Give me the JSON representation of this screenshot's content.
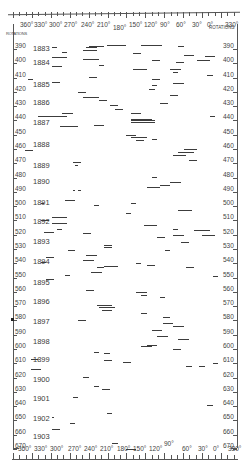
{
  "chart_data": {
    "type": "scatter",
    "title": "",
    "xlabel": "Longitude",
    "ylabel": "Rotations",
    "x_ticks_top": [
      "360°",
      "330°",
      "300°",
      "270°",
      "240°",
      "210°",
      "180°",
      "150°",
      "120°",
      "90°",
      "60°",
      "30°",
      "0°",
      "330°"
    ],
    "x_ticks_bottom": [
      "360°",
      "330°",
      "300°",
      "270°",
      "240°",
      "210°",
      "180°",
      "150°",
      "120°",
      "90°",
      "60°",
      "30°",
      "0°",
      "330°"
    ],
    "y_axis_label": "ROTATIONS",
    "y_ticks": [
      390,
      400,
      410,
      420,
      430,
      440,
      450,
      460,
      470,
      480,
      490,
      500,
      510,
      520,
      530,
      540,
      550,
      560,
      570,
      580,
      590,
      600,
      610,
      620,
      630,
      640,
      650,
      660,
      670
    ],
    "ylim": [
      385,
      672
    ],
    "xlim": [
      360,
      -30
    ],
    "years": [
      {
        "year": "1883",
        "rotation": 392
      },
      {
        "year": "1884",
        "rotation": 402
      },
      {
        "year": "1885",
        "rotation": 417
      },
      {
        "year": "1886",
        "rotation": 430
      },
      {
        "year": "1887",
        "rotation": 444
      },
      {
        "year": "1888",
        "rotation": 459
      },
      {
        "year": "1889",
        "rotation": 474
      },
      {
        "year": "1890",
        "rotation": 485
      },
      {
        "year": "1891",
        "rotation": 500
      },
      {
        "year": "1892",
        "rotation": 513
      },
      {
        "year": "1893",
        "rotation": 527
      },
      {
        "year": "1894",
        "rotation": 541
      },
      {
        "year": "1895",
        "rotation": 556
      },
      {
        "year": "1896",
        "rotation": 569
      },
      {
        "year": "1897",
        "rotation": 583
      },
      {
        "year": "1898",
        "rotation": 597
      },
      {
        "year": "1899",
        "rotation": 610
      },
      {
        "year": "1900",
        "rotation": 624
      },
      {
        "year": "1901",
        "rotation": 637
      },
      {
        "year": "1902",
        "rotation": 651
      },
      {
        "year": "1903",
        "rotation": 664
      }
    ],
    "segments": [
      {
        "r": 391,
        "from": 300,
        "to": 290
      },
      {
        "r": 391,
        "from": 235,
        "to": 215
      },
      {
        "r": 390,
        "from": 230,
        "to": 200
      },
      {
        "r": 389,
        "from": 195,
        "to": 160
      },
      {
        "r": 389,
        "from": 130,
        "to": 90
      },
      {
        "r": 390,
        "from": 60,
        "to": 50
      },
      {
        "r": 393,
        "from": 240,
        "to": 215
      },
      {
        "r": 394,
        "from": 280,
        "to": 270
      },
      {
        "r": 395,
        "from": 145,
        "to": 130
      },
      {
        "r": 396,
        "from": 50,
        "to": 30
      },
      {
        "r": 397,
        "from": 10,
        "to": -10
      },
      {
        "r": 398,
        "from": 300,
        "to": 270
      },
      {
        "r": 399,
        "from": 240,
        "to": 210
      },
      {
        "r": 400,
        "from": 110,
        "to": 95
      },
      {
        "r": 400,
        "from": 25,
        "to": 0
      },
      {
        "r": 401,
        "from": 65,
        "to": 50
      },
      {
        "r": 403,
        "from": 210,
        "to": 200
      },
      {
        "r": 404,
        "from": 300,
        "to": 280
      },
      {
        "r": 406,
        "from": 145,
        "to": 120
      },
      {
        "r": 406,
        "from": 75,
        "to": 55
      },
      {
        "r": 408,
        "from": 70,
        "to": 60
      },
      {
        "r": 410,
        "from": 5,
        "to": -5
      },
      {
        "r": 413,
        "from": 345,
        "to": 335
      },
      {
        "r": 412,
        "from": 230,
        "to": 215
      },
      {
        "r": 413,
        "from": 110,
        "to": 95
      },
      {
        "r": 415,
        "from": 300,
        "to": 285
      },
      {
        "r": 416,
        "from": 70,
        "to": 50
      },
      {
        "r": 417,
        "from": 110,
        "to": 100
      },
      {
        "r": 420,
        "from": 115,
        "to": 105
      },
      {
        "r": 422,
        "from": 250,
        "to": 235
      },
      {
        "r": 424,
        "from": 75,
        "to": 60
      },
      {
        "r": 426,
        "from": 240,
        "to": 210
      },
      {
        "r": 428,
        "from": 210,
        "to": 195
      },
      {
        "r": 430,
        "from": 95,
        "to": 80
      },
      {
        "r": 431,
        "from": 190,
        "to": 175
      },
      {
        "r": 434,
        "from": 180,
        "to": 165
      },
      {
        "r": 437,
        "from": 150,
        "to": 130
      },
      {
        "r": 439,
        "from": 325,
        "to": 270
      },
      {
        "r": 437,
        "from": 280,
        "to": 260
      },
      {
        "r": 439,
        "from": 0,
        "to": -10
      },
      {
        "r": 441,
        "from": 150,
        "to": 110
      },
      {
        "r": 442,
        "from": 150,
        "to": 105
      },
      {
        "r": 443,
        "from": 150,
        "to": 105
      },
      {
        "r": 446,
        "from": 285,
        "to": 250
      },
      {
        "r": 445,
        "from": 220,
        "to": 200
      },
      {
        "r": 452,
        "from": 160,
        "to": 140
      },
      {
        "r": 454,
        "from": 150,
        "to": 120
      },
      {
        "r": 456,
        "from": 140,
        "to": 125
      },
      {
        "r": 455,
        "from": 110,
        "to": 100
      },
      {
        "r": 463,
        "from": 350,
        "to": 335
      },
      {
        "r": 462,
        "from": 50,
        "to": 25
      },
      {
        "r": 464,
        "from": 60,
        "to": 30
      },
      {
        "r": 466,
        "from": 70,
        "to": 45
      },
      {
        "r": 471,
        "from": 260,
        "to": 245
      },
      {
        "r": 473,
        "from": 255,
        "to": 250
      },
      {
        "r": 470,
        "from": 40,
        "to": 25
      },
      {
        "r": 482,
        "from": 110,
        "to": 100
      },
      {
        "r": 485,
        "from": 75,
        "to": 55
      },
      {
        "r": 487,
        "from": 95,
        "to": 75
      },
      {
        "r": 489,
        "from": 120,
        "to": 95
      },
      {
        "r": 491,
        "from": 260,
        "to": 255
      },
      {
        "r": 491,
        "from": 250,
        "to": 245
      },
      {
        "r": 500,
        "from": 320,
        "to": 315
      },
      {
        "r": 498,
        "from": 275,
        "to": 255
      },
      {
        "r": 501,
        "from": 220,
        "to": 210
      },
      {
        "r": 500,
        "from": 150,
        "to": 140
      },
      {
        "r": 505,
        "from": 60,
        "to": 35
      },
      {
        "r": 507,
        "from": 160,
        "to": 150
      },
      {
        "r": 510,
        "from": 300,
        "to": 270
      },
      {
        "r": 512,
        "from": 320,
        "to": 305
      },
      {
        "r": 514,
        "from": 300,
        "to": 270
      },
      {
        "r": 515,
        "from": 125,
        "to": 100
      },
      {
        "r": 518,
        "from": 290,
        "to": 280
      },
      {
        "r": 518,
        "from": 70,
        "to": 60
      },
      {
        "r": 519,
        "from": 30,
        "to": 0
      },
      {
        "r": 520,
        "from": 315,
        "to": 295
      },
      {
        "r": 521,
        "from": 240,
        "to": 225
      },
      {
        "r": 522,
        "from": 70,
        "to": 50
      },
      {
        "r": 522,
        "from": 15,
        "to": -10
      },
      {
        "r": 524,
        "from": 100,
        "to": 85
      },
      {
        "r": 527,
        "from": 55,
        "to": 40
      },
      {
        "r": 529,
        "from": 200,
        "to": 185
      },
      {
        "r": 531,
        "from": 200,
        "to": 185
      },
      {
        "r": 533,
        "from": 270,
        "to": 255
      },
      {
        "r": 533,
        "from": 85,
        "to": 75
      },
      {
        "r": 536,
        "from": 235,
        "to": 215
      },
      {
        "r": 538,
        "from": 310,
        "to": 295
      },
      {
        "r": 540,
        "from": 240,
        "to": 220
      },
      {
        "r": 541,
        "from": 320,
        "to": 310
      },
      {
        "r": 542,
        "from": 140,
        "to": 130
      },
      {
        "r": 543,
        "from": 120,
        "to": 105
      },
      {
        "r": 544,
        "from": 200,
        "to": 175
      },
      {
        "r": 545,
        "from": 215,
        "to": 200
      },
      {
        "r": 545,
        "from": 45,
        "to": 30
      },
      {
        "r": 548,
        "from": 225,
        "to": 205
      },
      {
        "r": 550,
        "from": 275,
        "to": 265
      },
      {
        "r": 551,
        "from": -5,
        "to": -15
      },
      {
        "r": 553,
        "from": 310,
        "to": 295
      },
      {
        "r": 561,
        "from": 235,
        "to": 220
      },
      {
        "r": 562,
        "from": 140,
        "to": 120
      },
      {
        "r": 564,
        "from": 130,
        "to": 120
      },
      {
        "r": 566,
        "from": 95,
        "to": 85
      },
      {
        "r": 571,
        "from": 215,
        "to": 185
      },
      {
        "r": 573,
        "from": 210,
        "to": 180
      },
      {
        "r": 575,
        "from": 205,
        "to": 185
      },
      {
        "r": 577,
        "from": 130,
        "to": 120
      },
      {
        "r": 580,
        "from": 90,
        "to": 75
      },
      {
        "r": 582,
        "from": 250,
        "to": 235
      },
      {
        "r": 584,
        "from": 90,
        "to": 70
      },
      {
        "r": 586,
        "from": 70,
        "to": 50
      },
      {
        "r": 589,
        "from": 110,
        "to": 90
      },
      {
        "r": 593,
        "from": 100,
        "to": 80
      },
      {
        "r": 595,
        "from": 60,
        "to": 40
      },
      {
        "r": 599,
        "from": 120,
        "to": 100
      },
      {
        "r": 600,
        "from": 130,
        "to": 110
      },
      {
        "r": 602,
        "from": 70,
        "to": 55
      },
      {
        "r": 604,
        "from": 220,
        "to": 210
      },
      {
        "r": 605,
        "from": 200,
        "to": 190
      },
      {
        "r": 609,
        "from": 340,
        "to": 325
      },
      {
        "r": 610,
        "from": 200,
        "to": 185
      },
      {
        "r": 611,
        "from": 165,
        "to": 150
      },
      {
        "r": 612,
        "from": -5,
        "to": -15
      },
      {
        "r": 614,
        "from": 45,
        "to": 35
      },
      {
        "r": 614,
        "from": 20,
        "to": 10
      },
      {
        "r": 616,
        "from": 340,
        "to": 320
      },
      {
        "r": 622,
        "from": 240,
        "to": 230
      },
      {
        "r": 628,
        "from": 220,
        "to": 210
      },
      {
        "r": 630,
        "from": 205,
        "to": 190
      },
      {
        "r": 636,
        "from": 260,
        "to": 250
      },
      {
        "r": 641,
        "from": 5,
        "to": -5
      },
      {
        "r": 647,
        "from": 195,
        "to": 185
      },
      {
        "r": 650,
        "from": 300,
        "to": 295
      },
      {
        "r": 654,
        "from": 265,
        "to": 255
      },
      {
        "r": 658,
        "from": 300,
        "to": 285
      },
      {
        "r": 668,
        "from": 185,
        "to": 175
      },
      {
        "r": 672,
        "from": 160,
        "to": 140
      }
    ],
    "grid": false,
    "legend": null
  },
  "axis": {
    "top_labels": [
      "360°",
      "330°",
      "300°",
      "270°",
      "240°",
      "210°",
      "180°",
      "150°",
      "120°",
      "90°",
      "60°",
      "30°",
      "0°",
      "330°"
    ],
    "bottom_labels": [
      "360°",
      "330°",
      "300°",
      "270°",
      "240°",
      "210°",
      "180°",
      "150°",
      "120°",
      "90°",
      "60°",
      "30°",
      "0°",
      "330°"
    ],
    "rotations_label": "ROTATIONS",
    "rotation_ticks": [
      "390",
      "400",
      "410",
      "420",
      "430",
      "440",
      "450",
      "460",
      "470",
      "480",
      "490",
      "500",
      "510",
      "520",
      "530",
      "540",
      "550",
      "560",
      "570",
      "580",
      "590",
      "600",
      "610",
      "620",
      "630",
      "640",
      "650",
      "660",
      "670"
    ],
    "years": [
      "1883",
      "1884",
      "1885",
      "1886",
      "1887",
      "1888",
      "1889",
      "1890",
      "1891",
      "1892",
      "1893",
      "1894",
      "1895",
      "1896",
      "1897",
      "1898",
      "1899",
      "1900",
      "1901",
      "1902",
      "1903"
    ]
  },
  "colors": {
    "ink": "#3c3c3c",
    "paper": "#ffffff"
  }
}
